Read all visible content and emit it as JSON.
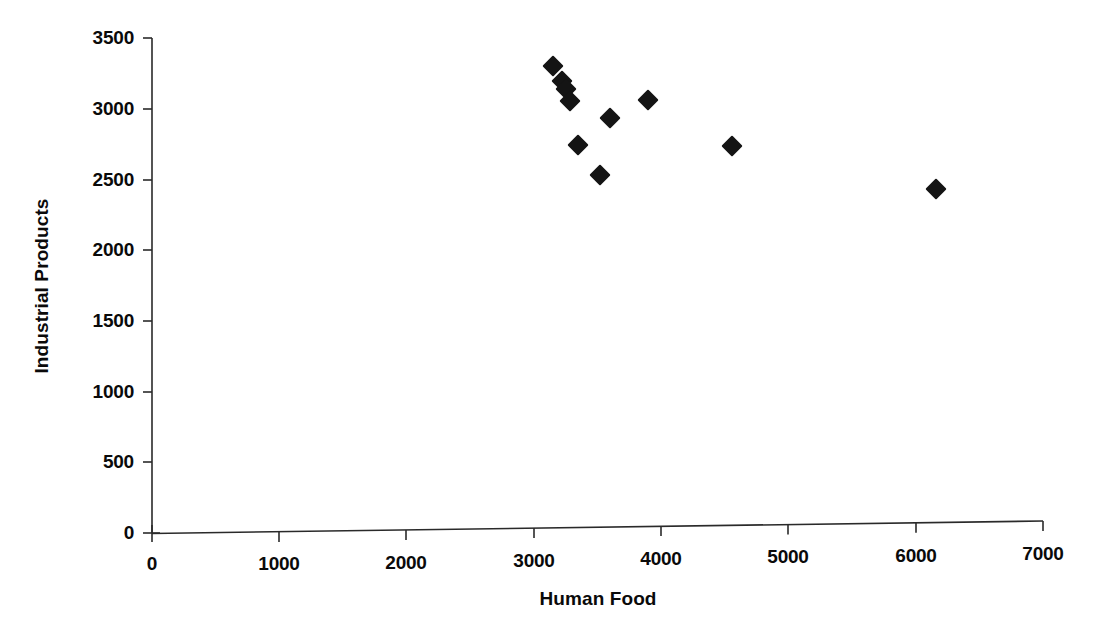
{
  "chart_data": {
    "type": "scatter",
    "title": "",
    "xlabel": "Human Food",
    "ylabel": "Industrial Products",
    "xlim": [
      0,
      7000
    ],
    "ylim": [
      0,
      3500
    ],
    "xticks": [
      0,
      1000,
      2000,
      3000,
      4000,
      5000,
      6000,
      7000
    ],
    "yticks": [
      0,
      500,
      1000,
      1500,
      2000,
      2500,
      3000,
      3500
    ],
    "xtick_labels": [
      "0",
      "1000",
      "2000",
      "3000",
      "4000",
      "5000",
      "6000",
      "7000"
    ],
    "ytick_labels": [
      "0",
      "500",
      "1000",
      "1500",
      "2000",
      "2500",
      "3000",
      "3500"
    ],
    "grid": false,
    "legend": null,
    "marker_shape": "diamond",
    "marker_color": "#141414",
    "series": [
      {
        "name": "",
        "points": [
          {
            "x": 3150,
            "y": 3260
          },
          {
            "x": 3220,
            "y": 3155
          },
          {
            "x": 3250,
            "y": 3100
          },
          {
            "x": 3285,
            "y": 3015
          },
          {
            "x": 3345,
            "y": 2700
          },
          {
            "x": 3520,
            "y": 2485
          },
          {
            "x": 3600,
            "y": 2890
          },
          {
            "x": 3900,
            "y": 3015
          },
          {
            "x": 4555,
            "y": 2680
          },
          {
            "x": 6160,
            "y": 2355
          }
        ]
      }
    ]
  },
  "axes": {
    "x_title": "Human Food",
    "y_title": "Industrial Products"
  }
}
